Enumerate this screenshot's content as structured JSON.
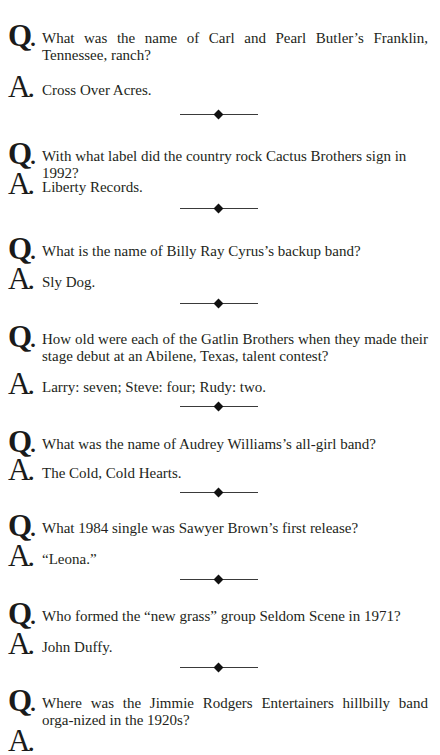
{
  "labels": {
    "question_letter": "Q",
    "answer_letter": "A",
    "dot": "."
  },
  "items": [
    {
      "question": "What was the name of Carl and Pearl Butler’s Franklin, Tennessee, ranch?",
      "answer": "Cross Over Acres."
    },
    {
      "question": "With what label did the country rock Cactus Brothers sign in 1992?",
      "answer": "Liberty Records."
    },
    {
      "question": "What is the name of Billy Ray Cyrus’s backup band?",
      "answer": "Sly Dog."
    },
    {
      "question": "How old were each of the Gatlin Brothers when they made their stage debut at an Abilene, Texas, talent contest?",
      "answer": "Larry: seven; Steve: four; Rudy: two."
    },
    {
      "question": "What was the name of Audrey Williams’s all-girl band?",
      "answer": "The Cold, Cold Hearts."
    },
    {
      "question": "What 1984 single was Sawyer Brown’s first release?",
      "answer": "“Leona.”"
    },
    {
      "question": "Who formed the “new grass” group Seldom Scene in 1971?",
      "answer": "John Duffy."
    },
    {
      "question": "Where was the Jimmie Rodgers Entertainers hillbilly band orga-nized in the 1920s?",
      "answer": ""
    }
  ],
  "colors": {
    "text": "#231f20",
    "divider": "#3a3a3a",
    "background": "#ffffff"
  }
}
